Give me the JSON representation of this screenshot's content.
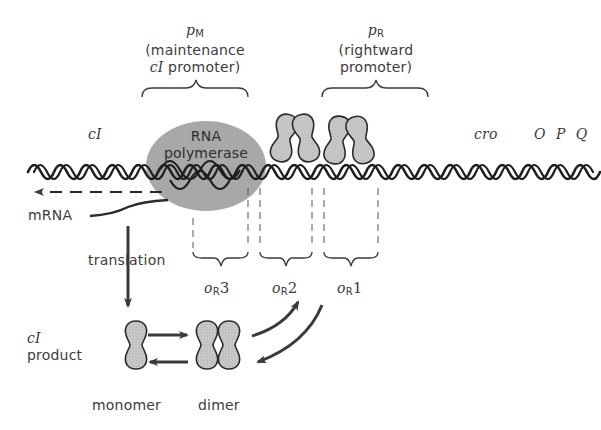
{
  "diagram": {
    "promoters": {
      "pM": {
        "symbol": "p",
        "subscript": "M",
        "line1": "(maintenance",
        "line2_italic": "cI",
        "line2_rest": " promoter)"
      },
      "pR": {
        "symbol": "p",
        "subscript": "R",
        "line1": "(rightward",
        "line2": "promoter)"
      }
    },
    "genes": {
      "cI": "cI",
      "cro": "cro",
      "opq": "O P Q"
    },
    "rna_polymerase": {
      "line1": "RNA",
      "line2": "polymerase",
      "color": "#a6a6a6"
    },
    "labels": {
      "mrna": "mRNA",
      "translation": "translation",
      "product_line1": "cI",
      "product_line2": "product",
      "monomer": "monomer",
      "dimer": "dimer"
    },
    "operators": [
      {
        "symbol": "o",
        "subscript": "R",
        "number": "3"
      },
      {
        "symbol": "o",
        "subscript": "R",
        "number": "2"
      },
      {
        "symbol": "o",
        "subscript": "R",
        "number": "1"
      }
    ],
    "colors": {
      "protein_fill": "#c4c4c4",
      "stroke": "#2a2a2a",
      "arrow": "#3a3a3a",
      "text": "#3c3c3c"
    }
  }
}
